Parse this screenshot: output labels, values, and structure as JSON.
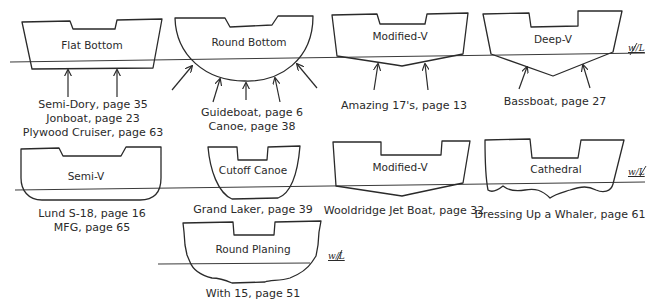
{
  "colors": {
    "ink": "#2a2a2a",
    "background": "#ffffff"
  },
  "waterline_label": "w/L",
  "hulls": {
    "flat_bottom": {
      "name": "Flat Bottom",
      "captions": [
        "Semi-Dory, page 35",
        "Jonboat, page 23",
        "Plywood Cruiser, page 63"
      ]
    },
    "round_bottom": {
      "name": "Round Bottom",
      "captions": [
        "Guideboat, page 6",
        "Canoe, page 38"
      ]
    },
    "modified_v_top": {
      "name": "Modified-V",
      "captions": [
        "Amazing 17's, page 13"
      ]
    },
    "deep_v": {
      "name": "Deep-V",
      "captions": [
        "Bassboat, page 27"
      ]
    },
    "semi_v": {
      "name": "Semi-V",
      "captions": [
        "Lund S-18, page 16",
        "MFG, page 65"
      ]
    },
    "cutoff_canoe": {
      "name": "Cutoff Canoe",
      "captions": [
        "Grand Laker, page 39"
      ]
    },
    "modified_v_bottom": {
      "name": "Modified-V",
      "captions": [
        "Wooldridge Jet Boat, page 32"
      ]
    },
    "cathedral": {
      "name": "Cathedral",
      "captions": [
        "Dressing Up a Whaler, page 61"
      ]
    },
    "round_planing": {
      "name": "Round Planing",
      "captions": [
        "With 15, page 51"
      ]
    }
  }
}
